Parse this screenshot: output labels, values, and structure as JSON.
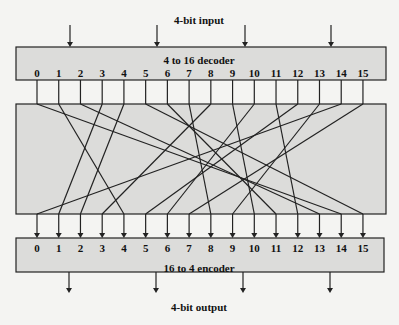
{
  "input_label": "4-bit input",
  "decoder_label": "4 to 16 decoder",
  "encoder_label": "16 to 4 encoder",
  "output_label": "4-bit output",
  "line_numbers": [
    "0",
    "1",
    "2",
    "3",
    "4",
    "5",
    "6",
    "7",
    "8",
    "9",
    "10",
    "11",
    "12",
    "13",
    "14",
    "15"
  ],
  "mapping": [
    14,
    4,
    13,
    1,
    2,
    15,
    11,
    8,
    3,
    10,
    6,
    12,
    5,
    9,
    0,
    7
  ],
  "colors": {
    "box_fill": "#dcdcda",
    "stroke": "#222222",
    "background": "#f4f4f2"
  }
}
